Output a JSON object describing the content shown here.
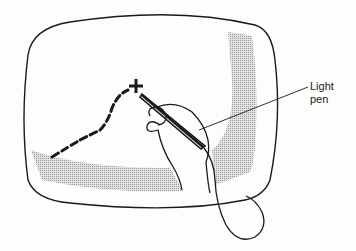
{
  "diagram": {
    "labels": [
      {
        "id": "light-pen",
        "lines": [
          "Light",
          "pen"
        ]
      }
    ],
    "elements": [
      "screen-outline",
      "shaded-display-region",
      "dashed-trace",
      "cross-cursor",
      "hand",
      "light-pen",
      "pen-cord"
    ],
    "colors": {
      "line": "#1a1a1a",
      "shade": "#c8c8c8",
      "background": "#fdfdfb"
    }
  }
}
